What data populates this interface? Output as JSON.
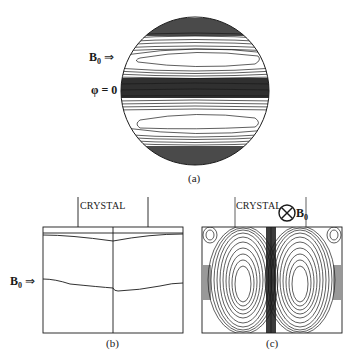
{
  "figure": {
    "panel_a": {
      "caption": "(a)",
      "field_label": "B",
      "field_subscript": "0",
      "field_arrow": "⇒",
      "phi_label": "φ = 0"
    },
    "panel_b": {
      "caption": "(b)",
      "crystal_label": "CRYSTAL",
      "field_label": "B",
      "field_subscript": "0",
      "field_arrow": "⇒"
    },
    "panel_c": {
      "caption": "(c)",
      "crystal_label": "CRYSTAL",
      "field_symbol": "⊗",
      "field_label": "B",
      "field_subscript": "0"
    }
  },
  "colors": {
    "ink": "#1a1a1a",
    "background": "#ffffff"
  }
}
